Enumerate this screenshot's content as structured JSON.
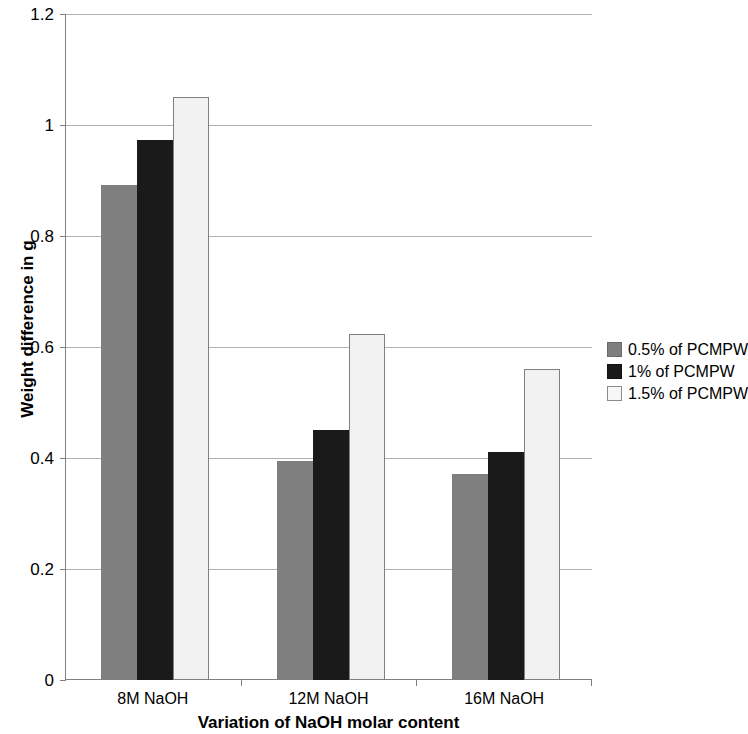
{
  "chart_data": {
    "type": "bar",
    "title": "",
    "xlabel": "Variation of NaOH molar content",
    "ylabel": "Weight difference in g",
    "categories": [
      "8M NaOH",
      "12M NaOH",
      "16M NaOH"
    ],
    "series": [
      {
        "name": "0.5% of PCMPW",
        "color": "#7f7f7f",
        "values": [
          0.892,
          0.395,
          0.371
        ]
      },
      {
        "name": "1% of PCMPW",
        "color": "#1a1a1a",
        "values": [
          0.973,
          0.45,
          0.411
        ]
      },
      {
        "name": "1.5% of PCMPW",
        "color": "#f2f2f2",
        "values": [
          1.05,
          0.623,
          0.56
        ]
      }
    ],
    "ylim": [
      0,
      1.2
    ],
    "yticks": [
      0,
      0.2,
      0.4,
      0.6,
      0.8,
      1.0,
      1.2
    ],
    "ytick_labels": [
      "0",
      "0.2",
      "0.4",
      "0.6",
      "0.8",
      "1",
      "1.2"
    ],
    "grid": true,
    "grid_axis": "y",
    "legend_position": "right"
  }
}
